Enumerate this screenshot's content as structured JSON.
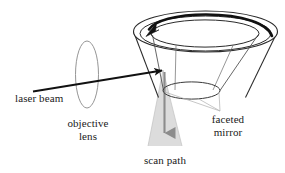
{
  "figure": {
    "name": "faceted-mirror-laser-scanner-diagram",
    "width": 285,
    "height": 173,
    "background": "#ffffff"
  },
  "labels": {
    "laser_beam": "laser beam",
    "objective_line1": "objective",
    "objective_line2": "lens",
    "faceted_line1": "faceted",
    "faceted_line2": "mirror",
    "scan_path": "scan path"
  },
  "colors": {
    "ink": "#1a1a1a",
    "outline": "#2b2b2b",
    "lens_outline": "#8a8a8a",
    "leader_gray": "#b0b0b0",
    "scan_fill": "#d9d9d9",
    "scan_arrow": "#8c8c8c",
    "text": "#1a1a1a",
    "background": "#ffffff"
  },
  "elements": {
    "rotation_arrow": {
      "name": "rotation-direction-arrow",
      "description": "thick curved arrow along top rim indicating mirror rotation",
      "direction": "counter-clockwise-viewed-from-above"
    },
    "mirror": {
      "name": "faceted-mirror-cone",
      "description": "truncated cone with annular top rim and inner faceted cone"
    },
    "laser_beam_ray": {
      "name": "laser-beam-ray",
      "description": "straight arrow from lower-left through lens to mirror surface"
    },
    "objective_lens": {
      "name": "objective-lens-ellipse",
      "description": "tall narrow ellipse representing lens in beam path"
    },
    "scan_path_cone": {
      "name": "scan-path-cone",
      "description": "shaded downward-widening triangle with central down arrow"
    },
    "facet_leaders": {
      "name": "facet-leader-lines",
      "description": "thin gray lines pointing from faceted mirror label to mirror facets"
    }
  }
}
